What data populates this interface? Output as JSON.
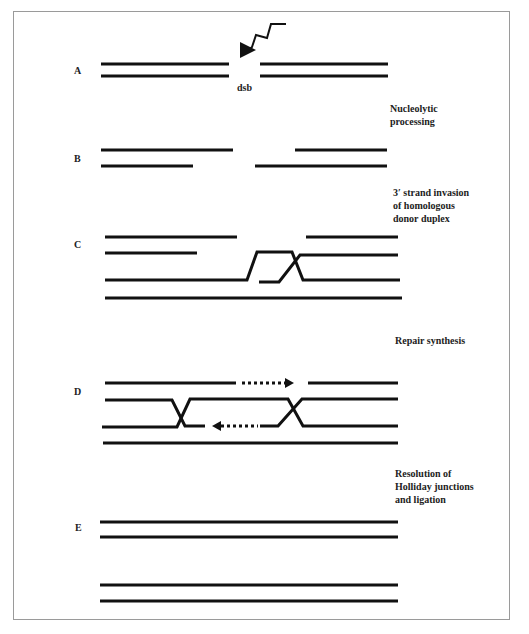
{
  "diagram": {
    "colors": {
      "strand": "#111111",
      "frame": "#9a9a9a",
      "background": "#ffffff"
    },
    "steps": [
      {
        "id": "A",
        "label": "A",
        "annotation": "dsb"
      },
      {
        "id": "B",
        "label": "B",
        "transition": [
          "Nucleolytic",
          "processing"
        ]
      },
      {
        "id": "C",
        "label": "C",
        "transition": [
          "3′ strand invasion",
          "of homologous",
          "donor duplex"
        ]
      },
      {
        "id": "D",
        "label": "D",
        "transition": [
          "Repair synthesis"
        ]
      },
      {
        "id": "E",
        "label": "E",
        "transition": [
          "Resolution of",
          "Holliday junctions",
          "and ligation"
        ]
      }
    ],
    "icons": {
      "break": "lightning-bolt-arrow",
      "synthesis_right": "dotted-arrow-right",
      "synthesis_left": "dotted-arrow-left"
    }
  }
}
